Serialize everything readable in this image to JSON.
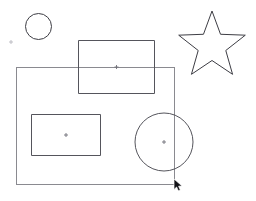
{
  "app": {
    "title": "Shapes Canvas",
    "background_color": "#ffffff",
    "width": 256,
    "height": 201
  },
  "canvas": {
    "name": "drawing-canvas",
    "stroke_color": "#55555c",
    "stroke_color_dark": "#3d3d44",
    "stroke_color_light": "#8a8a90",
    "marker_color": "#6e6e76",
    "tick_color": "#b8b8be"
  },
  "shapes": {
    "small_circle": {
      "label": "small circle",
      "cx": 38.5,
      "cy": 26.5,
      "r": 13,
      "stroke": "#3d3d44"
    },
    "star": {
      "label": "five pointed star",
      "cx": 212,
      "cy": 46,
      "outer_r": 35,
      "inner_r": 14.5,
      "points": 5,
      "rotation_deg": -90,
      "stroke": "#3d3d44",
      "path": "M 212 11 L 220.0 35.6 L 245.9 35.6 L 225.0 50.8 L 232.9 75.4 L 212 60.2 L 191.1 75.4 L 199.0 50.8 L 178.1 35.6 L 204.0 35.6 Z"
    },
    "top_rectangle": {
      "label": "top rectangle",
      "x": 78,
      "y": 40,
      "width": 77,
      "height": 54,
      "stroke": "#55555c",
      "center_x": 116.5,
      "center_y": 67,
      "has_center_marker": true
    },
    "large_rectangle": {
      "label": "large rectangle",
      "x": 16,
      "y": 67,
      "width": 159,
      "height": 118,
      "stroke": "#8a8a90",
      "center_x": 95.5,
      "center_y": 126,
      "has_center_marker": false
    },
    "inner_rectangle": {
      "label": "inner rectangle",
      "x": 31,
      "y": 114,
      "width": 70,
      "height": 42,
      "stroke": "#55555c",
      "center_x": 66,
      "center_y": 135,
      "has_center_marker": true
    },
    "large_circle": {
      "label": "large circle",
      "cx": 164,
      "cy": 142,
      "r": 29,
      "stroke": "#55555c",
      "has_center_marker": true
    },
    "corner_tick": {
      "label": "tick marker",
      "cx": 11,
      "cy": 42,
      "size": 3,
      "stroke": "#b8b8be"
    }
  },
  "cursor": {
    "name": "mouse-cursor",
    "kind": "arrow-pointer",
    "x": 174,
    "y": 179,
    "color": "#141418"
  }
}
